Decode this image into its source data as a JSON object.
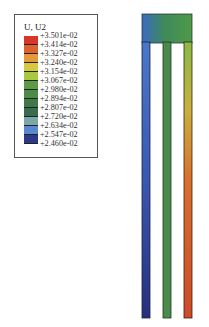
{
  "legend": {
    "title": "U, U2",
    "labels": [
      "+3.501e-02",
      "+3.414e-02",
      "+3.327e-02",
      "+3.240e-02",
      "+3.154e-02",
      "+3.067e-02",
      "+2.980e-02",
      "+2.894e-02",
      "+2.807e-02",
      "+2.720e-02",
      "+2.634e-02",
      "+2.547e-02",
      "+2.460e-02"
    ],
    "colors": [
      "#d8362a",
      "#e0602c",
      "#e49a3a",
      "#d8c83c",
      "#a8c840",
      "#5c9a48",
      "#4e8a4a",
      "#3e7a48",
      "#3a6a50",
      "#7aa8a8",
      "#5a88d0",
      "#2a3a88",
      "#202a6a"
    ]
  },
  "structure": {
    "left_leg_color_top": "#4a78c8",
    "left_leg_color_bottom": "#26307a",
    "middle_leg_color": "#4a8a4a",
    "right_leg_color_top": "#8aba48",
    "right_leg_color_bottom": "#cc4a2a",
    "crossbar_gradient": [
      "#3a6ac0",
      "#3f8a5a",
      "#4e9a48"
    ]
  }
}
